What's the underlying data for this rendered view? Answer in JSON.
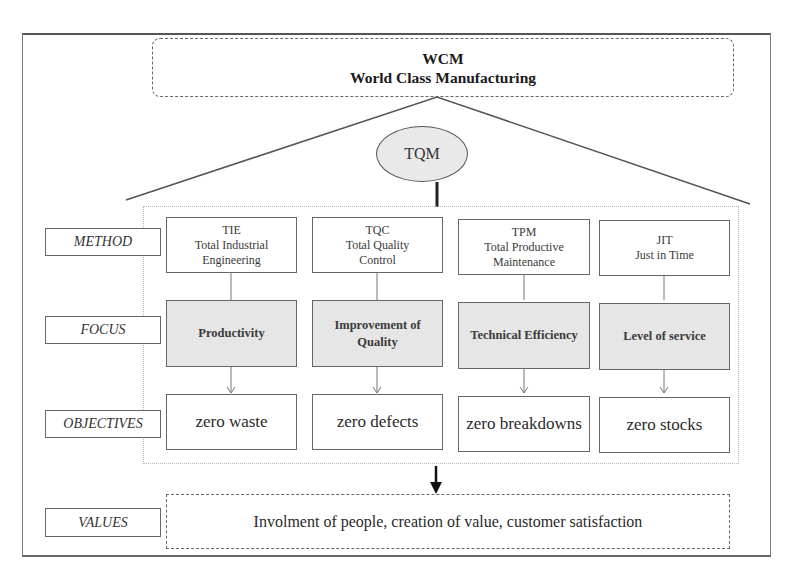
{
  "header": {
    "acronym": "WCM",
    "title": "World Class Manufacturing"
  },
  "core": {
    "label": "TQM"
  },
  "row_labels": {
    "method": "METHOD",
    "focus": "FOCUS",
    "objectives": "OBJECTIVES",
    "values": "VALUES"
  },
  "columns": [
    {
      "method_acronym": "TIE",
      "method_line1": "Total Industrial",
      "method_line2": "Engineering",
      "focus": "Productivity",
      "objective": "zero waste"
    },
    {
      "method_acronym": "TQC",
      "method_line1": "Total Quality",
      "method_line2": "Control",
      "focus": "Improvement of Quality",
      "objective": "zero defects"
    },
    {
      "method_acronym": "TPM",
      "method_line1": "Total Productive",
      "method_line2": "Maintenance",
      "focus": "Technical Efficiency",
      "objective": "zero breakdowns"
    },
    {
      "method_acronym": "JIT",
      "method_line1": "Just in Time",
      "method_line2": "",
      "focus": "Level of service",
      "objective": "zero stocks"
    }
  ],
  "values": {
    "text": "Involment of people, creation of value, customer satisfaction"
  },
  "colors": {
    "focus_fill": "#e6e6e6",
    "tqm_fill": "#e9e9e9",
    "stroke": "#666666"
  }
}
